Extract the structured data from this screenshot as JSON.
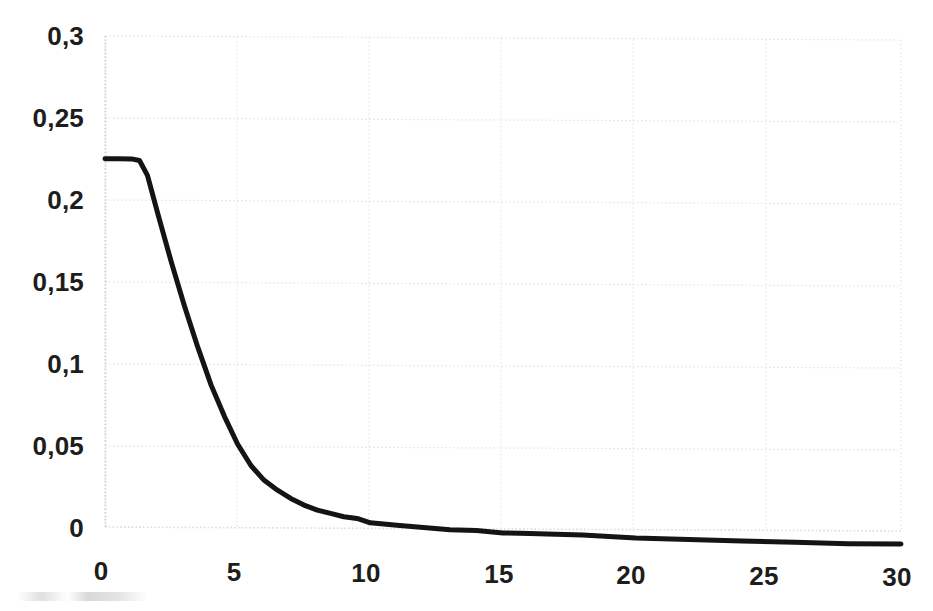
{
  "chart_data": {
    "type": "line",
    "title": "",
    "subtitle": "",
    "xlabel": "",
    "ylabel": "",
    "xlim": [
      0,
      30
    ],
    "ylim": [
      0,
      0.3
    ],
    "grid": true,
    "legend": false,
    "legend_position": "none",
    "decimal_separator": ",",
    "line_color": "#141414",
    "line_width_px": 5,
    "gridline_color": "#e3e3e3",
    "x_ticks": [
      0,
      5,
      10,
      15,
      20,
      25,
      30
    ],
    "x_tick_labels": [
      "0",
      "5",
      "10",
      "15",
      "20",
      "25",
      "30"
    ],
    "y_ticks": [
      0,
      0.05,
      0.1,
      0.15,
      0.2,
      0.25,
      0.3
    ],
    "y_tick_labels": [
      "0",
      "0,05",
      "0,1",
      "0,15",
      "0,2",
      "0,25",
      "0,3"
    ],
    "series": [
      {
        "name": "curve",
        "x": [
          0,
          0.5,
          1.0,
          1.3,
          1.6,
          2.0,
          2.5,
          3.0,
          3.5,
          4.0,
          4.5,
          5.0,
          5.5,
          6.0,
          6.5,
          7.0,
          7.5,
          8.0,
          8.5,
          9.0,
          9.5,
          10.0,
          11.0,
          12.0,
          13.0,
          14.0,
          15.0,
          16.0,
          17.0,
          18.0,
          20.0,
          22.0,
          24.0,
          26.0,
          28.0,
          30.0
        ],
        "y": [
          0.225,
          0.225,
          0.225,
          0.224,
          0.215,
          0.191,
          0.162,
          0.135,
          0.11,
          0.087,
          0.068,
          0.051,
          0.038,
          0.029,
          0.023,
          0.018,
          0.014,
          0.011,
          0.009,
          0.007,
          0.006,
          0.005,
          0.004,
          0.003,
          0.002,
          0.002,
          0.001,
          0.001,
          0.001,
          0.001,
          0.0,
          0.0,
          0.0,
          0.0,
          0.0,
          0.0
        ]
      }
    ],
    "annotations": []
  },
  "axis": {
    "y_labels": [
      "0,3",
      "0,25",
      "0,2",
      "0,15",
      "0,1",
      "0,05",
      "0"
    ],
    "x_labels": [
      "0",
      "5",
      "10",
      "15",
      "20",
      "25",
      "30"
    ]
  }
}
